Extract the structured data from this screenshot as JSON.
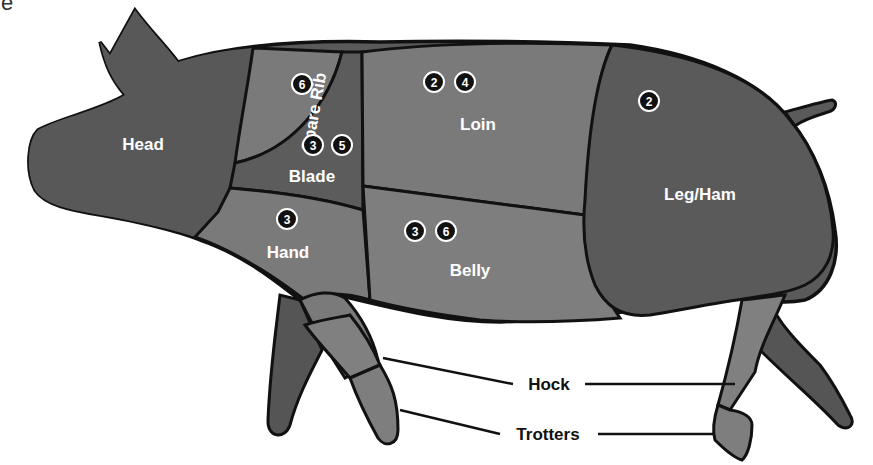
{
  "corner_text": "le",
  "colors": {
    "dark": "#5a5a5a",
    "medium": "#737373",
    "light": "#858585",
    "outline": "#111111",
    "background": "#ffffff",
    "label": "#ffffff",
    "badge": "#111111"
  },
  "cuts": {
    "head": {
      "label": "Head",
      "badges": []
    },
    "spare_rib": {
      "label": "Spare Rib",
      "badges": [
        "6"
      ]
    },
    "blade": {
      "label": "Blade",
      "badges": [
        "3",
        "5"
      ]
    },
    "loin": {
      "label": "Loin",
      "badges": [
        "2",
        "4"
      ]
    },
    "leg_ham": {
      "label": "Leg/Ham",
      "badges": [
        "2"
      ]
    },
    "hand": {
      "label": "Hand",
      "badges": [
        "3"
      ]
    },
    "belly": {
      "label": "Belly",
      "badges": [
        "3",
        "6"
      ]
    }
  },
  "callouts": {
    "hock": "Hock",
    "trotters": "Trotters"
  }
}
